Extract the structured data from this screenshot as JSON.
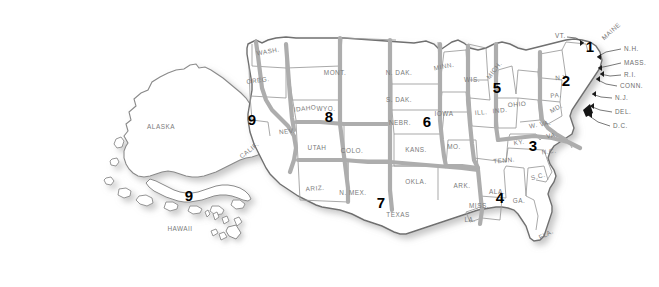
{
  "map": {
    "title": "United States map with numbered districts",
    "colors": {
      "state_fill": "#ffffff",
      "state_outline": "#8a8a8a",
      "district_boundary": "#a8a8a8",
      "outer_outline": "#6f6f6f",
      "shadow": "#cfcfcf",
      "label_text": "#7a7a7a",
      "number_text": "#000000",
      "background": "#ffffff"
    },
    "state_labels": [
      {
        "name": "ALASKA",
        "text": "ALASKA",
        "x": 161,
        "y": 126,
        "rot": 0
      },
      {
        "name": "HAWAII",
        "text": "HAWAII",
        "x": 180,
        "y": 228,
        "rot": 0
      },
      {
        "name": "WASH",
        "text": "WASH.",
        "x": 268,
        "y": 51,
        "rot": -10
      },
      {
        "name": "OREG",
        "text": "OREG.",
        "x": 258,
        "y": 80,
        "rot": -7
      },
      {
        "name": "CALIF",
        "text": "CALIF.",
        "x": 249,
        "y": 150,
        "rot": -38
      },
      {
        "name": "IDAHO",
        "text": "IDAHO",
        "x": 305,
        "y": 108,
        "rot": -6
      },
      {
        "name": "MONT",
        "text": "MONT.",
        "x": 335,
        "y": 72,
        "rot": 0
      },
      {
        "name": "WYO",
        "text": "WYO.",
        "x": 326,
        "y": 108,
        "rot": 0
      },
      {
        "name": "NEV",
        "text": "NEV.",
        "x": 287,
        "y": 131,
        "rot": -6
      },
      {
        "name": "UTAH",
        "text": "UTAH",
        "x": 317,
        "y": 147,
        "rot": 0
      },
      {
        "name": "COLO",
        "text": "COLO.",
        "x": 352,
        "y": 150,
        "rot": 0
      },
      {
        "name": "ARIZ",
        "text": "ARIZ.",
        "x": 315,
        "y": 188,
        "rot": -4
      },
      {
        "name": "NMEX",
        "text": "N. MEX.",
        "x": 353,
        "y": 192,
        "rot": 0
      },
      {
        "name": "TEXAS",
        "text": "TEXAS",
        "x": 398,
        "y": 214,
        "rot": 0
      },
      {
        "name": "OKLA",
        "text": "OKLA.",
        "x": 416,
        "y": 181,
        "rot": 0
      },
      {
        "name": "KANS",
        "text": "KANS.",
        "x": 416,
        "y": 149,
        "rot": 0
      },
      {
        "name": "NEBR",
        "text": "NEBR.",
        "x": 400,
        "y": 122,
        "rot": 0
      },
      {
        "name": "SDAK",
        "text": "S. DAK.",
        "x": 399,
        "y": 99,
        "rot": 0
      },
      {
        "name": "NDAK",
        "text": "N. DAK.",
        "x": 399,
        "y": 72,
        "rot": 0
      },
      {
        "name": "MINN",
        "text": "MINN.",
        "x": 444,
        "y": 66,
        "rot": -11
      },
      {
        "name": "IOWA",
        "text": "IOWA",
        "x": 444,
        "y": 113,
        "rot": 0
      },
      {
        "name": "MO",
        "text": "MO.",
        "x": 454,
        "y": 146,
        "rot": 0
      },
      {
        "name": "ARK",
        "text": "ARK.",
        "x": 462,
        "y": 185,
        "rot": 0
      },
      {
        "name": "LA",
        "text": "LA.",
        "x": 470,
        "y": 219,
        "rot": 0
      },
      {
        "name": "MISS",
        "text": "MISS.",
        "x": 479,
        "y": 205,
        "rot": 0
      },
      {
        "name": "ALA",
        "text": "ALA.",
        "x": 497,
        "y": 191,
        "rot": 0
      },
      {
        "name": "GA",
        "text": "GA.",
        "x": 519,
        "y": 200,
        "rot": 0
      },
      {
        "name": "FLA",
        "text": "FLA.",
        "x": 546,
        "y": 234,
        "rot": -28
      },
      {
        "name": "SC",
        "text": "S.C.",
        "x": 538,
        "y": 176,
        "rot": -14
      },
      {
        "name": "NC",
        "text": "N.C.",
        "x": 549,
        "y": 151,
        "rot": -8
      },
      {
        "name": "TENN",
        "text": "TENN.",
        "x": 504,
        "y": 160,
        "rot": -6
      },
      {
        "name": "KY",
        "text": "KY.",
        "x": 519,
        "y": 142,
        "rot": -8
      },
      {
        "name": "WIS",
        "text": "WIS.",
        "x": 472,
        "y": 79,
        "rot": 0
      },
      {
        "name": "MICH",
        "text": "MICH.",
        "x": 494,
        "y": 70,
        "rot": -52
      },
      {
        "name": "ILL",
        "text": "ILL.",
        "x": 481,
        "y": 112,
        "rot": -5
      },
      {
        "name": "IND",
        "text": "IND.",
        "x": 500,
        "y": 110,
        "rot": -5
      },
      {
        "name": "OHIO",
        "text": "OHIO",
        "x": 517,
        "y": 104,
        "rot": -5
      },
      {
        "name": "WVA",
        "text": "W. VA.",
        "x": 540,
        "y": 124,
        "rot": -10
      },
      {
        "name": "VA",
        "text": "VA.",
        "x": 552,
        "y": 135,
        "rot": -10
      },
      {
        "name": "PA",
        "text": "PA.",
        "x": 556,
        "y": 95,
        "rot": -5
      },
      {
        "name": "NY",
        "text": "N.Y.",
        "x": 562,
        "y": 77,
        "rot": -6
      },
      {
        "name": "MD",
        "text": "MD.",
        "x": 556,
        "y": 108,
        "rot": -30
      },
      {
        "name": "MAINE",
        "text": "MAINE",
        "x": 611,
        "y": 31,
        "rot": -42
      }
    ],
    "callouts": [
      {
        "name": "VT",
        "text": "VT.",
        "x": 555,
        "y": 35
      },
      {
        "name": "NH",
        "text": "N.H.",
        "x": 624,
        "y": 48
      },
      {
        "name": "MASS",
        "text": "MASS.",
        "x": 624,
        "y": 62
      },
      {
        "name": "RI",
        "text": "R.I.",
        "x": 624,
        "y": 74
      },
      {
        "name": "CONN",
        "text": "CONN.",
        "x": 620,
        "y": 85
      },
      {
        "name": "NJ",
        "text": "N.J.",
        "x": 615,
        "y": 97
      },
      {
        "name": "DEL",
        "text": "DEL.",
        "x": 615,
        "y": 111
      },
      {
        "name": "DC",
        "text": "D.C.",
        "x": 613,
        "y": 125
      }
    ],
    "districts": [
      {
        "name": "district-1",
        "number": "1",
        "x": 590,
        "y": 46
      },
      {
        "name": "district-2",
        "number": "2",
        "x": 566,
        "y": 80
      },
      {
        "name": "district-3",
        "number": "3",
        "x": 533,
        "y": 145
      },
      {
        "name": "district-4",
        "number": "4",
        "x": 500,
        "y": 197
      },
      {
        "name": "district-5",
        "number": "5",
        "x": 497,
        "y": 87
      },
      {
        "name": "district-6",
        "number": "6",
        "x": 427,
        "y": 121
      },
      {
        "name": "district-7",
        "number": "7",
        "x": 381,
        "y": 202
      },
      {
        "name": "district-8",
        "number": "8",
        "x": 329,
        "y": 116
      },
      {
        "name": "district-9-west",
        "number": "9",
        "x": 252,
        "y": 119
      },
      {
        "name": "district-9-pacific",
        "number": "9",
        "x": 189,
        "y": 195
      }
    ]
  }
}
